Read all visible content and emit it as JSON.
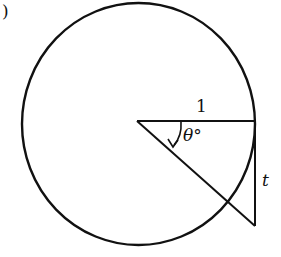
{
  "figure": {
    "part_label": ")",
    "radius_label": "1",
    "angle_label": "θ°",
    "tangent_label": "t"
  },
  "geometry": {
    "circle": {
      "cx": 138,
      "cy": 124,
      "r": 118
    },
    "center": [
      137,
      121
    ],
    "radius_end": [
      255,
      121
    ],
    "tangent_bottom": [
      255,
      226
    ],
    "stroke_color": "#111111"
  }
}
